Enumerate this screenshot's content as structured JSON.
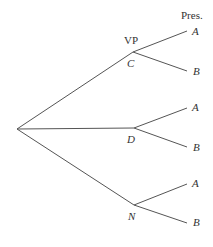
{
  "diagram": {
    "type": "tree",
    "header": "Pres.",
    "level1_label": "VP",
    "nodes": [
      {
        "label": "C",
        "children": [
          "A",
          "B"
        ]
      },
      {
        "label": "D",
        "children": [
          "A",
          "B"
        ]
      },
      {
        "label": "N",
        "children": [
          "A",
          "B"
        ]
      }
    ]
  }
}
